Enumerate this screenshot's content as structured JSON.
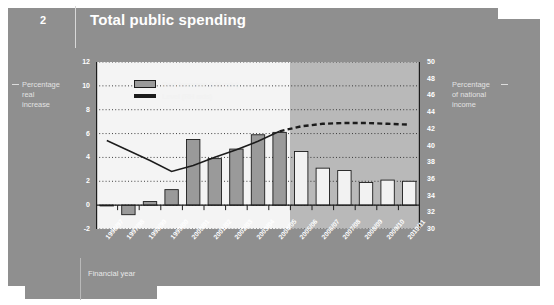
{
  "header": {
    "number": "2",
    "title": "Total public spending"
  },
  "axis_captions": {
    "left": [
      "Percentage",
      "real",
      "increase"
    ],
    "right": [
      "Percentage",
      "of national",
      "income"
    ]
  },
  "chart_data": {
    "type": "bar",
    "title": "Total public spending",
    "xlabel": "Financial year",
    "ylabel": "Percentage real increase",
    "y2label": "Percentage of national income",
    "grid": true,
    "legend_position": "top-left",
    "categories": [
      "1996/97",
      "1997/98",
      "1998/99",
      "1999/00",
      "2000/01",
      "2001/02",
      "2002/03",
      "2003/04",
      "2004/05",
      "2005/06",
      "2006/07",
      "2007/08",
      "2008/09",
      "2009/10",
      "2010/11"
    ],
    "ylim": [
      -2,
      12
    ],
    "yticks": [
      12,
      10,
      8,
      6,
      4,
      2,
      0,
      -2
    ],
    "y2lim": [
      30,
      50
    ],
    "y2ticks": [
      50,
      48,
      46,
      44,
      42,
      40,
      38,
      36,
      34,
      32,
      30
    ],
    "series": [
      {
        "name": "Real increase (LH axis)",
        "type": "bar",
        "axis": "left",
        "values": [
          0.0,
          -0.8,
          0.3,
          1.3,
          5.5,
          3.9,
          4.7,
          5.9,
          6.1,
          4.5,
          3.1,
          2.9,
          1.9,
          2.1,
          2.0
        ],
        "outturn_color": "#9a9a9a",
        "forecast_color": "#f2f2f2"
      },
      {
        "name": "Level (RH axis)",
        "type": "line",
        "axis": "right",
        "values": [
          40.6,
          39.4,
          38.2,
          36.9,
          37.6,
          38.6,
          39.5,
          40.5,
          41.7,
          42.3,
          42.6,
          42.7,
          42.7,
          42.6,
          42.5
        ],
        "outturn_style": "solid",
        "forecast_style": "dashed",
        "color": "#1c1c1c"
      }
    ],
    "annotations": {
      "outturn_span": [
        "1996/97",
        "2004/05"
      ],
      "forecast_span": [
        "2005/06",
        "2010/11"
      ]
    }
  },
  "legend": {
    "items": [
      {
        "label": "Real increase (LH axis)",
        "marker": "bar-swatch"
      },
      {
        "label": "Level (RH axis)",
        "marker": "line-swatch"
      }
    ]
  },
  "footer": {
    "x_title": "Financial year"
  },
  "colors": {
    "card": "#8f8f8f",
    "page": "#ffffff",
    "plot_outturn_bg": "#f4f4f4",
    "plot_forecast_bg": "#b9b9b9",
    "bar_outturn": "#9a9a9a",
    "bar_forecast": "#f2f2f2",
    "line": "#1c1c1c",
    "axis": "#1c1c1c",
    "tick_text": "#ffffff"
  }
}
